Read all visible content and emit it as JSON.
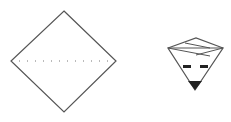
{
  "diagram": {
    "figures": [
      {
        "name": "folded-square",
        "description": "Square rotated 45 degrees with a dotted horizontal fold line"
      },
      {
        "name": "folded-face",
        "description": "Inverted triangle folded shape with crown top, two black eyes and black nose tip"
      }
    ],
    "colors": {
      "stroke": "#555555",
      "fill": "#222222",
      "background": "#ffffff"
    }
  }
}
